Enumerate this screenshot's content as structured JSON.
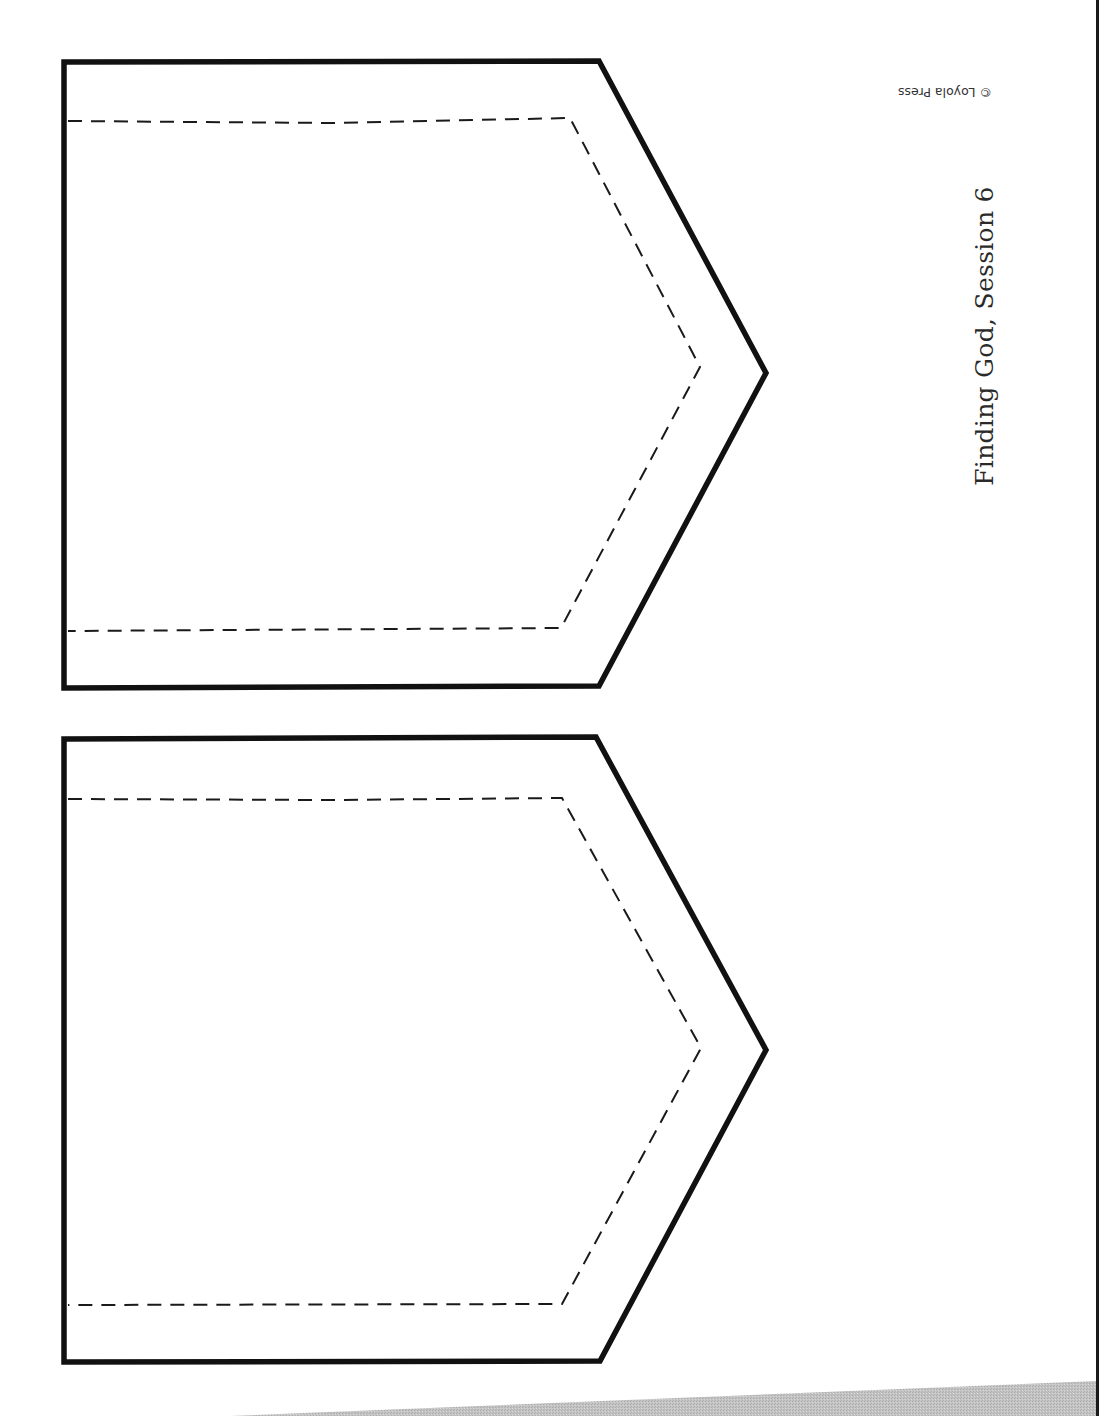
{
  "document": {
    "title": "Finding God, Session 6",
    "copyright": "© Loyola Press"
  },
  "template": {
    "shapes": [
      {
        "name": "pennant-upper",
        "type": "pennant",
        "outline": "solid",
        "cut_line": "dashed"
      },
      {
        "name": "pennant-lower",
        "type": "pennant",
        "outline": "solid",
        "cut_line": "dashed"
      }
    ]
  },
  "colors": {
    "ink": "#111111",
    "page": "#ffffff",
    "shadow": "#bdbdbd"
  }
}
